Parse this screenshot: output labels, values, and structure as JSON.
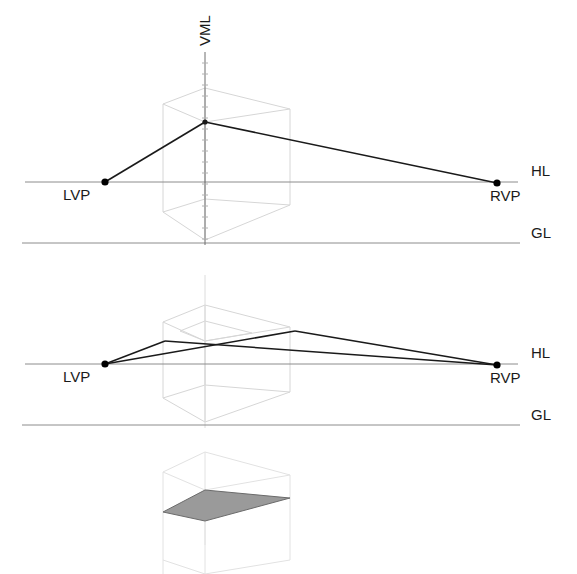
{
  "figure": {
    "title": "",
    "background_color": "#ffffff",
    "width": 577,
    "height": 574
  },
  "style": {
    "reference_line_color": "#8c8c8c",
    "construction_line_color": "#d6d6d6",
    "projection_line_color": "#1a1a1a",
    "vml_axis_color": "#6e6e6e",
    "vanishing_point_color": "#000000",
    "shaded_plane_fill": "#9a9a9a",
    "shaded_plane_stroke": "#6b6b6b",
    "label_color": "#1a1a1a"
  },
  "labels": {
    "vml": "VML",
    "hl": "HL",
    "gl": "GL",
    "lvp": "LVP",
    "rvp": "RVP"
  },
  "panels": [
    {
      "id": "panel-1",
      "name": "single-vertical-measuring-line",
      "horizon_line": {
        "label": "HL",
        "y": 182,
        "x1": 25,
        "x2": 518,
        "label_x": 531,
        "label_y": 176
      },
      "ground_line": {
        "label": "GL",
        "y": 243,
        "x1": 22,
        "x2": 520,
        "label_x": 531,
        "label_y": 238
      },
      "left_vanishing_point": {
        "label": "LVP",
        "x": 105,
        "y": 182,
        "label_x": 67,
        "label_y": 200
      },
      "right_vanishing_point": {
        "label": "RVP",
        "x": 497,
        "y": 183,
        "label_x": 492,
        "label_y": 201
      },
      "vml_axis": {
        "label": "VML",
        "x": 205,
        "y_top": 52,
        "y_bottom": 245,
        "label_x": 205,
        "label_y": 46,
        "tick_count": 17,
        "tick_half_width": 3
      },
      "apex": {
        "x": 205,
        "y": 122
      },
      "projection_lines": [
        {
          "name": "apex-to-lvp",
          "x1": 205,
          "y1": 122,
          "x2": 105,
          "y2": 182
        },
        {
          "name": "apex-to-rvp",
          "x1": 205,
          "y1": 122,
          "x2": 497,
          "y2": 183
        }
      ],
      "cube": {
        "top_face": [
          [
            205,
            122
          ],
          [
            163,
            104
          ],
          [
            205,
            88
          ],
          [
            290,
            109
          ]
        ],
        "bottom_face": [
          [
            205,
            240
          ],
          [
            163,
            212
          ],
          [
            205,
            199
          ],
          [
            290,
            205
          ]
        ],
        "verticals": [
          [
            205,
            122,
            205,
            240
          ],
          [
            163,
            104,
            163,
            212
          ],
          [
            205,
            88,
            205,
            199
          ],
          [
            290,
            109,
            290,
            205
          ]
        ]
      }
    },
    {
      "id": "panel-2",
      "name": "crossing-measuring-lines",
      "horizon_line": {
        "label": "HL",
        "y": 364,
        "x1": 25,
        "x2": 518,
        "label_x": 531,
        "label_y": 358
      },
      "ground_line": {
        "label": "GL",
        "y": 425,
        "x1": 22,
        "x2": 520,
        "label_x": 531,
        "label_y": 420
      },
      "left_vanishing_point": {
        "label": "LVP",
        "x": 105,
        "y": 364,
        "label_x": 67,
        "label_y": 382
      },
      "right_vanishing_point": {
        "label": "RVP",
        "x": 497,
        "y": 365,
        "label_x": 492,
        "label_y": 383
      },
      "vml_axis": {
        "x": 205,
        "y_top": 275,
        "y_bottom": 428
      },
      "projection_lines": [
        {
          "name": "lvp-to-upper-right",
          "x1": 105,
          "y1": 364,
          "x2": 295,
          "y2": 331
        },
        {
          "name": "upper-right-to-rvp",
          "x1": 295,
          "y1": 331,
          "x2": 497,
          "y2": 365
        },
        {
          "name": "lvp-to-upper-left",
          "x1": 105,
          "y1": 364,
          "x2": 165,
          "y2": 341
        },
        {
          "name": "upper-left-to-rvp",
          "x1": 165,
          "y1": 341,
          "x2": 497,
          "y2": 365
        }
      ],
      "cube": {
        "outer_top": [
          [
            205,
            341
          ],
          [
            163,
            322
          ],
          [
            205,
            305
          ],
          [
            290,
            327
          ]
        ],
        "outer_bottom": [
          [
            205,
            422
          ],
          [
            163,
            398
          ],
          [
            205,
            385
          ],
          [
            290,
            392
          ]
        ],
        "inner_top": [
          [
            205,
            341
          ],
          [
            180,
            331
          ],
          [
            205,
            321
          ],
          [
            252,
            333
          ]
        ]
      }
    },
    {
      "id": "panel-3",
      "name": "shaded-plane-in-cube",
      "shaded_plane": {
        "name": "measured-plane",
        "points": [
          [
            163,
            512
          ],
          [
            205,
            490
          ],
          [
            290,
            498
          ],
          [
            205,
            521
          ]
        ],
        "fill": "#9a9a9a",
        "stroke": "#6b6b6b"
      },
      "cube": {
        "top_face": [
          [
            205,
            521
          ],
          [
            163,
            505
          ],
          [
            205,
            486
          ],
          [
            290,
            498
          ]
        ],
        "verticals": [
          [
            205,
            521,
            205,
            574
          ],
          [
            163,
            505,
            163,
            574
          ],
          [
            290,
            498,
            290,
            574
          ]
        ],
        "top_outer": [
          [
            205,
            490
          ],
          [
            163,
            472
          ],
          [
            205,
            452
          ],
          [
            290,
            475
          ]
        ]
      }
    }
  ]
}
